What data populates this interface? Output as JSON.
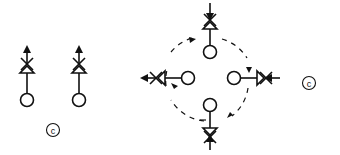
{
  "diagram": {
    "stroke_color": "#111111",
    "background": "#ffffff",
    "left_group": {
      "symbols": [
        {
          "id": "left-symbol-1",
          "node": {
            "cx": 27,
            "cy": 100
          },
          "valve_cx": 27,
          "valve_cy": 66,
          "arrow_dir": "up"
        },
        {
          "id": "left-symbol-2",
          "node": {
            "cx": 79,
            "cy": 100
          },
          "valve_cx": 79,
          "valve_cy": 66,
          "arrow_dir": "up"
        }
      ],
      "label": {
        "text": "c",
        "cx": 53,
        "cy": 130
      }
    },
    "right_group": {
      "center": {
        "cx": 210,
        "cy": 78
      },
      "orbit_radius": 46,
      "symbols": [
        {
          "id": "top",
          "node": {
            "cx": 210,
            "cy": 52
          },
          "valve": {
            "cx": 210,
            "cy": 20
          },
          "orientation": "up",
          "arrow_dir": "in"
        },
        {
          "id": "left",
          "node": {
            "cx": 188,
            "cy": 78
          },
          "valve": {
            "cx": 157,
            "cy": 78
          },
          "orientation": "left",
          "arrow_dir": "out"
        },
        {
          "id": "right",
          "node": {
            "cx": 234,
            "cy": 78
          },
          "valve": {
            "cx": 266,
            "cy": 78
          },
          "orientation": "right",
          "arrow_dir": "in"
        },
        {
          "id": "bottom",
          "node": {
            "cx": 210,
            "cy": 105
          },
          "valve": {
            "cx": 210,
            "cy": 137
          },
          "orientation": "down",
          "arrow_dir": "in"
        }
      ],
      "label": {
        "text": "c",
        "cx": 309,
        "cy": 83
      }
    }
  }
}
